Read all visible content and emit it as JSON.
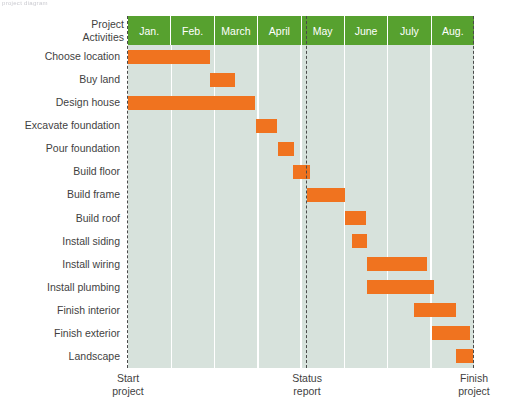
{
  "caption_sliver": "project diagram",
  "chart_data": {
    "type": "bar",
    "variant": "gantt",
    "title": "",
    "xlabel": "",
    "ylabel": "Project Activities",
    "corner_header_line1": "Project",
    "corner_header_line2": "Activities",
    "categories": [
      "Jan.",
      "Feb.",
      "March",
      "April",
      "May",
      "June",
      "July",
      "Aug."
    ],
    "xlim": [
      0,
      8
    ],
    "grid": true,
    "legend": "none",
    "colors": {
      "bar": "#f0731f",
      "header": "#57a12f",
      "plot_background": "#d7e2dc",
      "gridline": "#ffffff",
      "milestone": "#4a4a4a",
      "text": "#3f3f3f"
    },
    "tasks": [
      {
        "label": "Choose location",
        "start": 0.0,
        "end": 1.9
      },
      {
        "label": "Buy land",
        "start": 1.9,
        "end": 2.47
      },
      {
        "label": "Design house",
        "start": 0.0,
        "end": 2.94
      },
      {
        "label": "Excavate foundation",
        "start": 2.96,
        "end": 3.45
      },
      {
        "label": "Pour foundation",
        "start": 3.47,
        "end": 3.84
      },
      {
        "label": "Build floor",
        "start": 3.82,
        "end": 4.21
      },
      {
        "label": "Build frame",
        "start": 4.14,
        "end": 5.02
      },
      {
        "label": "Build roof",
        "start": 5.02,
        "end": 5.5
      },
      {
        "label": "Install siding",
        "start": 5.18,
        "end": 5.53
      },
      {
        "label": "Install wiring",
        "start": 5.53,
        "end": 6.91
      },
      {
        "label": "Install plumbing",
        "start": 5.53,
        "end": 7.08
      },
      {
        "label": "Finish interior",
        "start": 6.61,
        "end": 7.58
      },
      {
        "label": "Finish exterior",
        "start": 7.03,
        "end": 7.91
      },
      {
        "label": "Landscape",
        "start": 7.58,
        "end": 7.98
      }
    ],
    "milestones": [
      {
        "name": "start-project",
        "at": 0.0,
        "line1": "Start",
        "line2": "project"
      },
      {
        "name": "status-report",
        "at": 4.14,
        "line1": "Status",
        "line2": "report"
      },
      {
        "name": "finish-project",
        "at": 8.0,
        "line1": "Finish",
        "line2": "project"
      }
    ]
  }
}
